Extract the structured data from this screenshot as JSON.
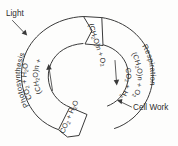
{
  "diagram": {
    "background_color": "#fdfdfc",
    "ink_color": "#3a3a3a"
  },
  "callouts": {
    "light": "Light",
    "cell_work": "Cell Work"
  },
  "processes": {
    "left": "Photosynthesis",
    "right": "Respiration"
  },
  "compounds": {
    "carbohydrate_label": "(CH",
    "carbohydrate_sub": "2",
    "carbohydrate_mid": "O)n + O",
    "carbohydrate_sub2": "2",
    "co2_label": "CO",
    "co2_sub": "2",
    "water_mid": " + H",
    "water_sub": "2",
    "water_end": "O"
  },
  "nodes": {
    "top_block": "(CH2O)n + O2",
    "bottom_block": "CO2 + H2O"
  },
  "arrows": {
    "left_direction": "up",
    "right_direction": "down"
  }
}
